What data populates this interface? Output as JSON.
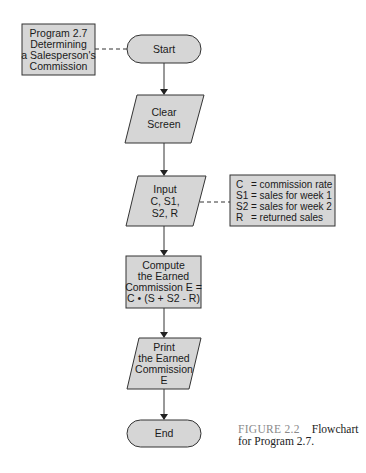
{
  "colors": {
    "fill": "#d6d6d6",
    "stroke": "#333333",
    "text": "#1a1a1a",
    "caption_label": "#8a8a8a"
  },
  "title_box": {
    "lines": [
      "Program 2.7",
      "Determining",
      "a Salesperson's",
      "Commission"
    ]
  },
  "nodes": {
    "start": {
      "type": "terminal",
      "label": "Start"
    },
    "clear": {
      "type": "io",
      "lines": [
        "Clear",
        "Screen"
      ]
    },
    "input": {
      "type": "io",
      "lines": [
        "Input",
        "C, S1,",
        "S2, R"
      ]
    },
    "compute": {
      "type": "process",
      "lines": [
        "Compute",
        "the Earned",
        "Commission E =",
        "C • (S + S2 - R)"
      ]
    },
    "print": {
      "type": "io",
      "lines": [
        "Print",
        "the Earned",
        "Commission",
        "E"
      ]
    },
    "end": {
      "type": "terminal",
      "label": "End"
    }
  },
  "legend": {
    "rows": [
      {
        "symbol": "C",
        "desc": "= commission rate"
      },
      {
        "symbol": "S1",
        "desc": "= sales for week 1"
      },
      {
        "symbol": "S2",
        "desc": "= sales for week 2"
      },
      {
        "symbol": "R",
        "desc": "= returned sales"
      }
    ]
  },
  "caption": {
    "label": "FIGURE 2.2",
    "line1": "Flowchart",
    "line2": "for Program 2.7."
  }
}
